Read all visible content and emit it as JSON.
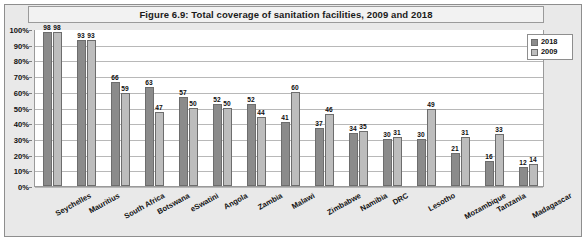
{
  "chart_data": {
    "type": "bar",
    "title": "Figure 6.9: Total coverage of sanitation facilities, 2009 and 2018",
    "xlabel": "",
    "ylabel": "",
    "ylim": [
      0,
      100
    ],
    "grid": true,
    "legend_position": "top-right",
    "y_ticks": [
      "0%",
      "10%",
      "20%",
      "30%",
      "40%",
      "50%",
      "60%",
      "70%",
      "80%",
      "90%",
      "100%"
    ],
    "categories": [
      "Seychelles",
      "Mauritius",
      "South Africa",
      "Botswana",
      "eSwatini",
      "Angola",
      "Zambia",
      "Malawi",
      "Zimbabwe",
      "Namibia",
      "DRC",
      "Lesotho",
      "Mozambique",
      "Tanzania",
      "Madagascar"
    ],
    "series": [
      {
        "name": "2018",
        "color": "#8b8b8b",
        "values": [
          98,
          93,
          66,
          63,
          57,
          52,
          52,
          41,
          37,
          34,
          30,
          30,
          21,
          16,
          12
        ]
      },
      {
        "name": "2009",
        "color": "#bdbdbd",
        "values": [
          98,
          93,
          59,
          47,
          50,
          50,
          44,
          60,
          46,
          35,
          31,
          49,
          31,
          33,
          14
        ]
      }
    ]
  },
  "legend": {
    "entries": [
      {
        "label": "2018"
      },
      {
        "label": "2009"
      }
    ]
  },
  "colors": {
    "series_2018": "#8b8b8b",
    "series_2009": "#bdbdbd",
    "panel_background": "#e9e9e9",
    "plot_background": "#ffffff",
    "gridline": "#b8b8b8",
    "border": "#8e8e8e"
  }
}
